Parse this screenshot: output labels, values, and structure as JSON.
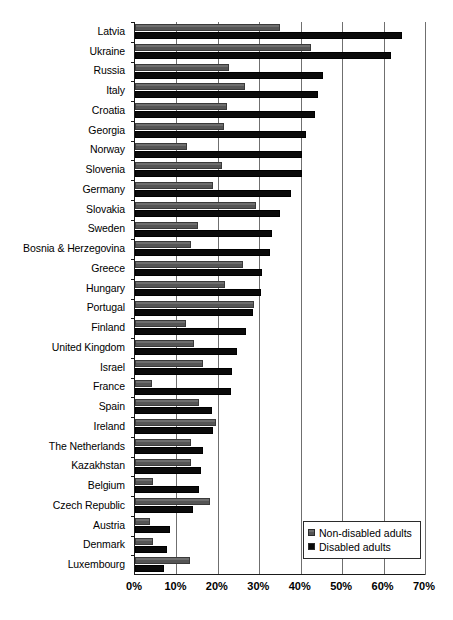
{
  "chart_data": {
    "type": "bar",
    "orientation": "horizontal",
    "title": "",
    "subtitle": "",
    "xlabel": "",
    "ylabel": "",
    "xlim": [
      0,
      70
    ],
    "xtick_labels": [
      "0%",
      "10%",
      "20%",
      "30%",
      "40%",
      "50%",
      "60%",
      "70%"
    ],
    "xticks": [
      0,
      10,
      20,
      30,
      40,
      50,
      60,
      70
    ],
    "grid": true,
    "grid_axis": "x",
    "legend_position": "bottom-right",
    "value_unit": "%",
    "categories": [
      "Latvia",
      "Ukraine",
      "Russia",
      "Italy",
      "Croatia",
      "Georgia",
      "Norway",
      "Slovenia",
      "Germany",
      "Slovakia",
      "Sweden",
      "Bosnia & Herzegovina",
      "Greece",
      "Hungary",
      "Portugal",
      "Finland",
      "United Kingdom",
      "Israel",
      "France",
      "Spain",
      "Ireland",
      "The Netherlands",
      "Kazakhstan",
      "Belgium",
      "Czech Republic",
      "Austria",
      "Denmark",
      "Luxembourg"
    ],
    "series": [
      {
        "name": "Non-disabled adults",
        "color": "#585858",
        "values": [
          35.0,
          42.4,
          22.7,
          26.6,
          22.2,
          21.4,
          12.6,
          21.0,
          18.8,
          29.3,
          15.1,
          13.5,
          26.1,
          21.7,
          28.8,
          12.2,
          14.2,
          16.3,
          4.1,
          15.5,
          19.6,
          13.5,
          13.5,
          4.4,
          18.1,
          3.7,
          4.4,
          13.2
        ]
      },
      {
        "name": "Disabled adults",
        "color": "#0a0a0a",
        "values": [
          64.4,
          61.7,
          45.4,
          44.1,
          43.4,
          41.3,
          40.2,
          40.2,
          37.6,
          34.9,
          33.0,
          32.6,
          30.7,
          30.5,
          28.5,
          26.8,
          24.6,
          23.4,
          23.2,
          18.5,
          18.8,
          16.3,
          15.9,
          15.5,
          14.1,
          8.4,
          7.7,
          7.1
        ]
      }
    ]
  },
  "legend": {
    "items": [
      {
        "label": "Non-disabled adults",
        "swatch": "gray-square-icon"
      },
      {
        "label": "Disabled adults",
        "swatch": "black-square-icon"
      }
    ]
  }
}
